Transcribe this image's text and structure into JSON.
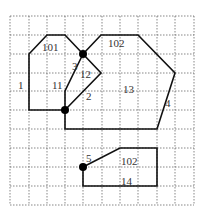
{
  "diagram": {
    "type": "grid-polygon-diagram",
    "grid": {
      "cols": 10,
      "rows": 10,
      "style": "dotted"
    },
    "labels": [
      {
        "id": "l101a",
        "text": "101",
        "x": 42,
        "y": 51
      },
      {
        "id": "l1",
        "text": "1",
        "x": 18,
        "y": 89
      },
      {
        "id": "l11",
        "text": "11",
        "x": 52,
        "y": 89
      },
      {
        "id": "l3",
        "text": "3",
        "x": 72,
        "y": 70
      },
      {
        "id": "l12",
        "text": "12",
        "x": 80,
        "y": 78
      },
      {
        "id": "l2",
        "text": "2",
        "x": 86,
        "y": 100
      },
      {
        "id": "l102a",
        "text": "102",
        "x": 108,
        "y": 47
      },
      {
        "id": "l13",
        "text": "13",
        "x": 123,
        "y": 93
      },
      {
        "id": "l4",
        "text": "4",
        "x": 165,
        "y": 107
      },
      {
        "id": "l5",
        "text": "5",
        "x": 86,
        "y": 162
      },
      {
        "id": "l102b",
        "text": "102",
        "x": 121,
        "y": 165
      },
      {
        "id": "l14",
        "text": "14",
        "x": 121,
        "y": 185
      }
    ],
    "nodes": [
      {
        "id": "dot-top",
        "x": 83,
        "y": 54
      },
      {
        "id": "dot-mid",
        "x": 65,
        "y": 110
      },
      {
        "id": "dot-bottom",
        "x": 83,
        "y": 167
      }
    ]
  }
}
